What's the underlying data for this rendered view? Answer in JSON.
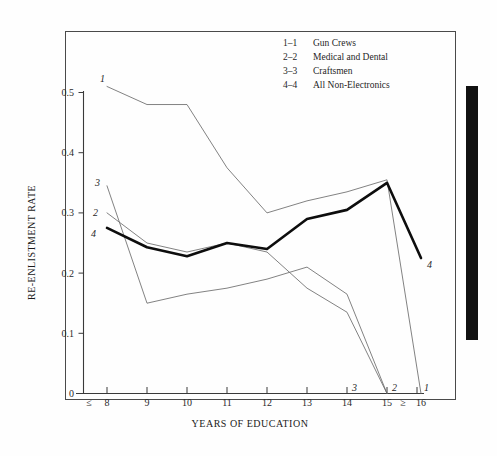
{
  "chart_data": {
    "type": "line",
    "title": "",
    "xlabel": "YEARS OF EDUCATION",
    "ylabel": "RE-ENLISTMENT RATE",
    "x": [
      "≤ 8",
      "9",
      "10",
      "11",
      "12",
      "13",
      "14",
      "15",
      "≥ 16"
    ],
    "x_numeric": [
      8,
      9,
      10,
      11,
      12,
      13,
      14,
      15,
      16
    ],
    "xlim": [
      8,
      16
    ],
    "ylim": [
      0,
      0.52
    ],
    "yticks": [
      0,
      0.1,
      0.2,
      0.3,
      0.4,
      0.5
    ],
    "ytick_labels": [
      "0",
      "0.1",
      "0.2",
      "0.3",
      "0.4",
      "0.5"
    ],
    "grid": false,
    "legend_position": "top-center",
    "series": [
      {
        "key": "1",
        "marker": "1–1",
        "name": "Gun Crews",
        "style": "thin",
        "values": [
          0.51,
          0.48,
          0.48,
          0.375,
          0.3,
          0.32,
          0.335,
          0.355,
          0.0
        ],
        "end_label": "1"
      },
      {
        "key": "2",
        "marker": "2–2",
        "name": "Medical and Dental",
        "style": "thin",
        "values": [
          0.3,
          0.25,
          0.235,
          0.25,
          0.235,
          0.175,
          0.135,
          0.0,
          null
        ],
        "end_label": "2"
      },
      {
        "key": "3",
        "marker": "3–3",
        "name": "Craftsmen",
        "style": "thin",
        "values": [
          0.345,
          0.15,
          0.165,
          0.175,
          0.19,
          0.21,
          0.165,
          0.0,
          null
        ],
        "end_label": "3"
      },
      {
        "key": "4",
        "marker": "4–4",
        "name": "All Non-Electronics",
        "style": "bold",
        "values": [
          0.275,
          0.243,
          0.228,
          0.25,
          0.24,
          0.29,
          0.305,
          0.35,
          0.225
        ],
        "end_label": "4"
      }
    ],
    "start_labels": [
      {
        "text": "1",
        "series": "1"
      },
      {
        "text": "3",
        "series": "3"
      },
      {
        "text": "2",
        "series": "2"
      },
      {
        "text": "4",
        "series": "4"
      }
    ]
  },
  "legend": {
    "entries": [
      {
        "key": "1–1",
        "label": "Gun Crews"
      },
      {
        "key": "2–2",
        "label": "Medical and Dental"
      },
      {
        "key": "3–3",
        "label": "Craftsmen"
      },
      {
        "key": "4–4",
        "label": "All Non-Electronics"
      }
    ]
  },
  "axes": {
    "y_title": "RE-ENLISTMENT RATE",
    "x_title": "YEARS OF EDUCATION",
    "y_ticks": [
      "0.5",
      "0.4",
      "0.3",
      "0.2",
      "0.1",
      "0"
    ],
    "x_ticks": [
      "≤",
      "8",
      "9",
      "10",
      "11",
      "12",
      "13",
      "14",
      "15",
      "≥",
      "16"
    ]
  },
  "decoration": {
    "side_bar_color": "#111111"
  }
}
